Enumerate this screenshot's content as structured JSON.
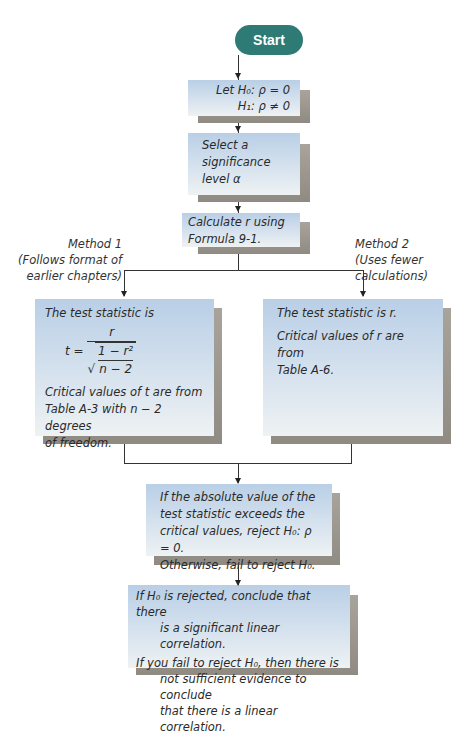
{
  "start": {
    "label": "Start",
    "color": "#2e7a74"
  },
  "hypotheses": {
    "line1": "Let H₀: ρ = 0",
    "line2": "H₁: ρ ≠ 0"
  },
  "significance": {
    "line1": "Select a",
    "line2": "significance",
    "line3": "level α"
  },
  "calculate": {
    "line1": "Calculate r using",
    "line2": "Formula 9-1."
  },
  "method1": {
    "label": {
      "line1": "Method 1",
      "line2": "(Follows format of",
      "line3": "earlier chapters)"
    },
    "intro": "The test statistic is",
    "formula": {
      "lhs": "t =",
      "numerator": "r",
      "inner_num": "1 − r²",
      "inner_den": "n − 2"
    },
    "critical": {
      "line1": "Critical values of t are from",
      "line2": "Table A-3 with n − 2 degrees",
      "line3": "of freedom."
    }
  },
  "method2": {
    "label": {
      "line1": "Method 2",
      "line2": "(Uses fewer",
      "line3": "calculations)"
    },
    "intro": "The test statistic is r.",
    "critical": {
      "line1": "Critical values of r are from",
      "line2": "Table A-6."
    }
  },
  "decision": {
    "line1": "If the absolute value of the",
    "line2": "test statistic exceeds the",
    "line3": "critical values, reject H₀: ρ = 0.",
    "line4": "Otherwise, fail to reject H₀."
  },
  "conclusion": {
    "line1": "If H₀ is rejected, conclude that there",
    "line2": "is a significant linear correlation.",
    "line3": "If you fail to reject H₀, then there is",
    "line4": "not sufficient evidence to conclude",
    "line5": "that there is a linear correlation."
  }
}
